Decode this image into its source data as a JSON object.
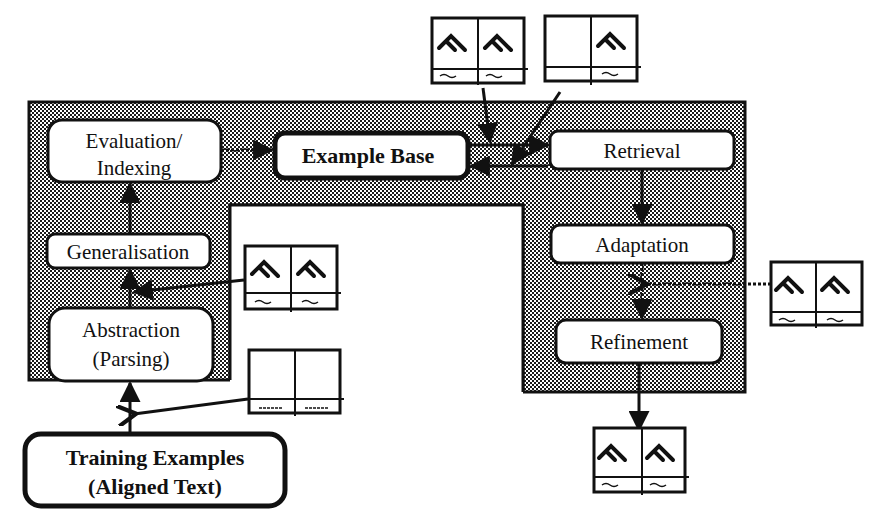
{
  "diagram": {
    "nodes": {
      "evaluation": {
        "line1": "Evaluation/",
        "line2": "Indexing"
      },
      "example_base": {
        "label": "Example Base"
      },
      "generalisation": {
        "label": "Generalisation"
      },
      "abstraction": {
        "line1": "Abstraction",
        "line2": "(Parsing)"
      },
      "training": {
        "line1": "Training Examples",
        "line2": "(Aligned Text)"
      },
      "retrieval": {
        "label": "Retrieval"
      },
      "adaptation": {
        "label": "Adaptation"
      },
      "refinement": {
        "label": "Refinement"
      }
    },
    "example_cards": [
      {
        "id": "stored-pair",
        "description": "full source/target example pair",
        "left_glyph": true,
        "right_glyph": true
      },
      {
        "id": "query-input",
        "description": "input with target only",
        "left_glyph": false,
        "right_glyph": true
      },
      {
        "id": "generalised-pair",
        "description": "generalised example pair",
        "left_glyph": true,
        "right_glyph": true
      },
      {
        "id": "raw-aligned",
        "description": "raw aligned text pair",
        "left_glyph": false,
        "right_glyph": false
      },
      {
        "id": "adaptation-input",
        "description": "example used for adaptation",
        "left_glyph": true,
        "right_glyph": true
      },
      {
        "id": "output-pair",
        "description": "final translated output",
        "left_glyph": true,
        "right_glyph": true
      }
    ],
    "colors": {
      "stroke": "#111111",
      "shade_dot": "#1a1a1a",
      "background": "#ffffff",
      "box_fill": "#ffffff"
    }
  }
}
